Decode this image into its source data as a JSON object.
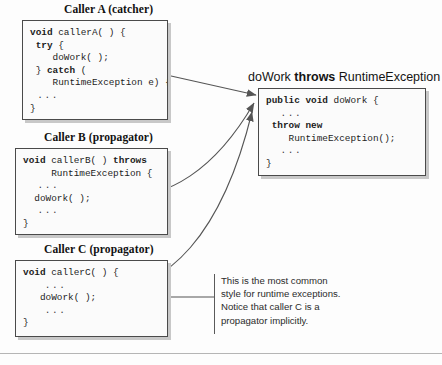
{
  "figure": {
    "panels": [
      {
        "id": "caller-a",
        "title": "Caller A (catcher)",
        "code": [
          {
            "segments": [
              {
                "t": "void",
                "bold": true
              },
              {
                "t": " callerA( ) {",
                "bold": false
              }
            ]
          },
          {
            "segments": [
              {
                "t": " ",
                "bold": false
              },
              {
                "t": "try",
                "bold": true
              },
              {
                "t": " {",
                "bold": false
              }
            ]
          },
          {
            "segments": [
              {
                "t": "    doWork( );",
                "bold": false
              }
            ]
          },
          {
            "segments": [
              {
                "t": " } ",
                "bold": false
              },
              {
                "t": "catch",
                "bold": true
              },
              {
                "t": " (",
                "bold": false
              }
            ]
          },
          {
            "segments": [
              {
                "t": "    RuntimeException e) {",
                "bold": false
              }
            ]
          },
          {
            "segments": [
              {
                "t": " ...",
                "bold": false
              }
            ]
          },
          {
            "segments": [
              {
                "t": "}",
                "bold": false
              }
            ]
          }
        ]
      },
      {
        "id": "caller-b",
        "title": "Caller B (propagator)",
        "code": [
          {
            "segments": [
              {
                "t": "void",
                "bold": true
              },
              {
                "t": " callerB( ) ",
                "bold": false
              },
              {
                "t": "throws",
                "bold": true
              }
            ]
          },
          {
            "segments": [
              {
                "t": "     RuntimeException {",
                "bold": false
              }
            ]
          },
          {
            "segments": [
              {
                "t": "  ...",
                "bold": false
              }
            ]
          },
          {
            "segments": [
              {
                "t": "  doWork( );",
                "bold": false
              }
            ]
          },
          {
            "segments": [
              {
                "t": "  ...",
                "bold": false
              }
            ]
          },
          {
            "segments": [
              {
                "t": "}",
                "bold": false
              }
            ]
          }
        ]
      },
      {
        "id": "caller-c",
        "title": "Caller C (propagator)",
        "code": [
          {
            "segments": [
              {
                "t": "void",
                "bold": true
              },
              {
                "t": " callerC( ) {",
                "bold": false
              }
            ]
          },
          {
            "segments": [
              {
                "t": "   ...",
                "bold": false
              }
            ]
          },
          {
            "segments": [
              {
                "t": "   doWork( );",
                "bold": false
              }
            ]
          },
          {
            "segments": [
              {
                "t": "   ...",
                "bold": false
              }
            ]
          },
          {
            "segments": [
              {
                "t": "}",
                "bold": false
              }
            ]
          }
        ]
      },
      {
        "id": "dowork",
        "title_plain_1": "doWork ",
        "title_keyword": "throws",
        "title_plain_2": " RuntimeException",
        "code": [
          {
            "segments": [
              {
                "t": "public void",
                "bold": true
              },
              {
                "t": " doWork {",
                "bold": false
              }
            ]
          },
          {
            "segments": [
              {
                "t": "  ...",
                "bold": false
              }
            ]
          },
          {
            "segments": [
              {
                "t": " ",
                "bold": false
              },
              {
                "t": "throw new",
                "bold": true
              }
            ]
          },
          {
            "segments": [
              {
                "t": "    RuntimeException();",
                "bold": false
              }
            ]
          },
          {
            "segments": [
              {
                "t": "  ...",
                "bold": false
              }
            ]
          },
          {
            "segments": [
              {
                "t": "}",
                "bold": false
              }
            ]
          }
        ]
      }
    ],
    "annotation": {
      "lines": [
        "This is the most common",
        "style for runtime exceptions.",
        "Notice that caller C is a",
        "propagator implicitly."
      ]
    },
    "colors": {
      "box_border": "#4a4a4a",
      "box_shadow": "#c8c8c8",
      "arrow": "#555555",
      "rule": "#b5b5b5"
    }
  }
}
